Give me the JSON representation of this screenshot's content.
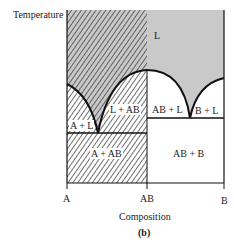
{
  "figure": {
    "y_axis_label": "Temperature",
    "x_axis_label": "Composition",
    "caption": "(b)",
    "x_ticks": [
      "A",
      "AB",
      "B"
    ],
    "regions": {
      "liquid": "L",
      "a_plus_l": "A + L",
      "l_plus_ab": "L + AB",
      "ab_plus_l": "AB + L",
      "b_plus_l": "B + L",
      "a_plus_ab": "A + AB",
      "ab_plus_b": "AB + B"
    },
    "colors": {
      "liquid_fill": "#c9c9c9",
      "hatch_line": "#333333",
      "boundary": "#111111"
    }
  }
}
